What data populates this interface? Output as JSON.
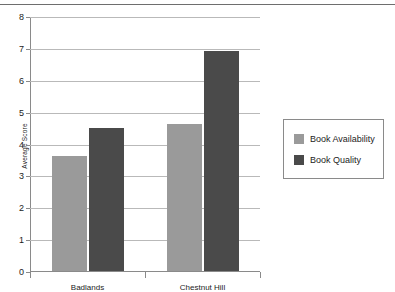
{
  "chart_data": {
    "type": "bar",
    "title": "",
    "xlabel": "",
    "ylabel": "Average Score",
    "categories": [
      "Badlands",
      "Chestnut Hill"
    ],
    "series": [
      {
        "name": "Book Availability",
        "color": "#9a9a9a",
        "values": [
          3.6,
          4.6
        ]
      },
      {
        "name": "Book Quality",
        "color": "#4a4a4a",
        "values": [
          4.5,
          6.9
        ]
      }
    ],
    "ylim": [
      0,
      8
    ],
    "yticks": [
      0,
      1,
      2,
      3,
      4,
      5,
      6,
      7,
      8
    ],
    "ytick_labels": [
      "0",
      "1",
      "2",
      "3",
      "4",
      "5",
      "6",
      "7",
      "8"
    ],
    "grid": true,
    "legend_position": "right"
  },
  "legend": {
    "entries": [
      {
        "label": "Book Availability"
      },
      {
        "label": "Book Quality"
      }
    ]
  }
}
